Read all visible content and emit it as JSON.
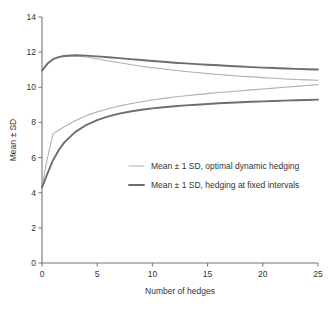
{
  "chart_data": {
    "type": "line",
    "title": "",
    "xlabel": "Number of hedges",
    "ylabel": "Mean ± SD",
    "xlim": [
      0,
      25
    ],
    "ylim": [
      0,
      14
    ],
    "xticks": [
      0,
      5,
      10,
      15,
      20,
      25
    ],
    "yticks": [
      0,
      2,
      4,
      6,
      8,
      10,
      12,
      14
    ],
    "grid": false,
    "legend_position": "center",
    "colors": {
      "optimal_dynamic": "#b0b0b0",
      "fixed_intervals": "#6e6e6e",
      "axis": "#777777",
      "text": "#333333"
    },
    "x": [
      0,
      0.5,
      1,
      1.5,
      2,
      3,
      4,
      5,
      6,
      7,
      8,
      9,
      10,
      11,
      12,
      13,
      14,
      15,
      16,
      17,
      18,
      19,
      20,
      21,
      22,
      23,
      24,
      25
    ],
    "series": [
      {
        "name": "Mean + 1 SD, optimal dynamic hedging",
        "group": "optimal_dynamic",
        "bound": "upper",
        "color": "#b0b0b0",
        "width": 1.1,
        "values": [
          10.95,
          11.35,
          11.6,
          11.72,
          11.78,
          11.8,
          11.72,
          11.62,
          11.5,
          11.4,
          11.3,
          11.2,
          11.12,
          11.04,
          10.97,
          10.9,
          10.84,
          10.78,
          10.73,
          10.68,
          10.63,
          10.59,
          10.55,
          10.51,
          10.47,
          10.44,
          10.42,
          10.4
        ]
      },
      {
        "name": "Mean - 1 SD, optimal dynamic hedging",
        "group": "optimal_dynamic",
        "bound": "lower",
        "color": "#b0b0b0",
        "width": 1.1,
        "values": [
          4.35,
          6.0,
          7.35,
          7.55,
          7.75,
          8.1,
          8.38,
          8.6,
          8.78,
          8.93,
          9.06,
          9.18,
          9.28,
          9.37,
          9.45,
          9.52,
          9.58,
          9.64,
          9.7,
          9.75,
          9.8,
          9.85,
          9.9,
          9.95,
          10.0,
          10.05,
          10.1,
          10.15
        ]
      },
      {
        "name": "Mean + 1 SD, hedging at fixed intervals",
        "group": "fixed_intervals",
        "bound": "upper",
        "color": "#6e6e6e",
        "width": 1.9,
        "values": [
          10.95,
          11.35,
          11.6,
          11.72,
          11.78,
          11.82,
          11.8,
          11.76,
          11.71,
          11.66,
          11.6,
          11.55,
          11.5,
          11.45,
          11.4,
          11.36,
          11.32,
          11.28,
          11.25,
          11.21,
          11.18,
          11.15,
          11.12,
          11.1,
          11.07,
          11.05,
          11.03,
          11.01
        ]
      },
      {
        "name": "Mean - 1 SD, hedging at fixed intervals",
        "group": "fixed_intervals",
        "bound": "lower",
        "color": "#6e6e6e",
        "width": 1.9,
        "values": [
          4.3,
          5.1,
          5.85,
          6.4,
          6.85,
          7.45,
          7.85,
          8.13,
          8.34,
          8.5,
          8.62,
          8.72,
          8.8,
          8.86,
          8.92,
          8.97,
          9.01,
          9.05,
          9.09,
          9.12,
          9.15,
          9.18,
          9.2,
          9.22,
          9.24,
          9.26,
          9.28,
          9.3
        ]
      }
    ],
    "legend": [
      {
        "label": "Mean ± 1 SD, optimal dynamic hedging",
        "color": "#b0b0b0",
        "width": 1.1
      },
      {
        "label": "Mean ± 1 SD, hedging at fixed intervals",
        "color": "#6e6e6e",
        "width": 1.9
      }
    ]
  }
}
